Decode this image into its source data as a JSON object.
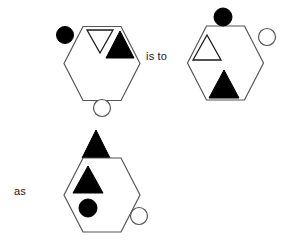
{
  "diagram": {
    "type": "visual-analogy-puzzle",
    "connectors": [
      {
        "id": "is-to",
        "label": "is to",
        "x": 146,
        "y": 51
      },
      {
        "id": "as",
        "label": "as",
        "x": 14,
        "y": 186
      }
    ],
    "colors": {
      "fill_black": "#000000",
      "fill_white": "#ffffff",
      "stroke": "#555555",
      "stroke_dark": "#1a1a1a",
      "background": "#ffffff",
      "text": "#1a1a1a"
    },
    "stroke_width": 1.2,
    "panels": [
      {
        "id": "panel-a",
        "name": "first-term-hexagon",
        "role": "A",
        "hexagon": {
          "cx": 102,
          "cy": 63.5,
          "rx": 38,
          "ry": 37
        },
        "shapes": [
          {
            "id": "a-circle-black-outside",
            "name": "black-circle-outside-top-left",
            "kind": "circle",
            "fill": "black",
            "position": "outside-top-left",
            "cx": 65,
            "cy": 35,
            "r": 8.5
          },
          {
            "id": "a-triangle-white-down-inside",
            "name": "white-triangle-down-inside-top",
            "kind": "triangle",
            "orientation": "down",
            "fill": "white",
            "position": "inside-top-center",
            "points": "87,30 113,30 100,53"
          },
          {
            "id": "a-triangle-black-up-inside",
            "name": "black-triangle-up-inside-top-right",
            "kind": "triangle",
            "orientation": "up",
            "fill": "black",
            "position": "inside-top-right",
            "points": "120,31 134,58 106,58"
          },
          {
            "id": "a-circle-white-outside",
            "name": "white-circle-outside-bottom",
            "kind": "circle",
            "fill": "white",
            "position": "outside-bottom-center",
            "cx": 102,
            "cy": 108,
            "r": 8.5
          }
        ]
      },
      {
        "id": "panel-b",
        "name": "second-term-hexagon",
        "role": "B",
        "hexagon": {
          "cx": 225.5,
          "cy": 63,
          "rx": 38,
          "ry": 37
        },
        "shapes": [
          {
            "id": "b-circle-black-outside",
            "name": "black-circle-outside-top",
            "kind": "circle",
            "fill": "black",
            "position": "outside-top-center",
            "cx": 223,
            "cy": 17,
            "r": 9
          },
          {
            "id": "b-triangle-white-up-inside",
            "name": "white-triangle-up-inside-left",
            "kind": "triangle",
            "orientation": "up",
            "fill": "white",
            "position": "inside-top-left",
            "points": "207,35 221,60 193,60"
          },
          {
            "id": "b-circle-white-outside",
            "name": "white-circle-outside-right",
            "kind": "circle",
            "fill": "white",
            "position": "outside-top-right",
            "cx": 267,
            "cy": 37,
            "r": 8.5
          },
          {
            "id": "b-triangle-black-up-inside",
            "name": "black-triangle-up-inside-bottom",
            "kind": "triangle",
            "orientation": "up",
            "fill": "black",
            "position": "inside-bottom-center",
            "points": "224,70 239,98 209,98"
          }
        ]
      },
      {
        "id": "panel-c",
        "name": "third-term-hexagon",
        "role": "C",
        "hexagon": {
          "cx": 102,
          "cy": 195,
          "rx": 38,
          "ry": 37
        },
        "shapes": [
          {
            "id": "c-triangle-black-up-outside",
            "name": "black-triangle-up-outside-top",
            "kind": "triangle",
            "orientation": "up",
            "fill": "black",
            "position": "outside-top-center",
            "points": "96,130 110,158 82,158"
          },
          {
            "id": "c-triangle-black-up-inside",
            "name": "black-triangle-up-inside-top-left",
            "kind": "triangle",
            "orientation": "up",
            "fill": "black",
            "position": "inside-top-left",
            "points": "88,166 103,193 73,193"
          },
          {
            "id": "c-circle-black-inside",
            "name": "black-circle-inside-bottom-left",
            "kind": "circle",
            "fill": "black",
            "position": "inside-bottom-left",
            "cx": 88,
            "cy": 208,
            "r": 9
          },
          {
            "id": "c-circle-white-outside",
            "name": "white-circle-outside-bottom-right",
            "kind": "circle",
            "fill": "white",
            "position": "outside-bottom-right",
            "cx": 139,
            "cy": 216,
            "r": 8.5
          }
        ]
      }
    ]
  }
}
